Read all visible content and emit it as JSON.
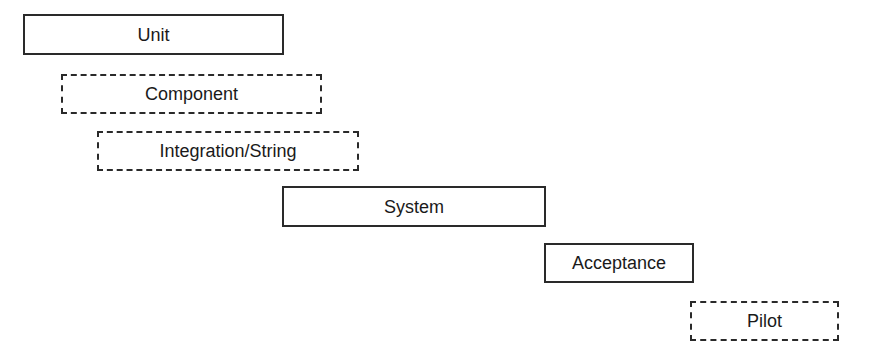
{
  "diagram": {
    "type": "staggered-test-stages",
    "stages": [
      {
        "label": "Unit",
        "style": "solid",
        "x": 23,
        "y": 14,
        "w": 261,
        "h": 41
      },
      {
        "label": "Component",
        "style": "dashed",
        "x": 61,
        "y": 74,
        "w": 261,
        "h": 40
      },
      {
        "label": "Integration/String",
        "style": "dashed",
        "x": 97,
        "y": 131,
        "w": 262,
        "h": 40
      },
      {
        "label": "System",
        "style": "solid",
        "x": 282,
        "y": 186,
        "w": 264,
        "h": 41
      },
      {
        "label": "Acceptance",
        "style": "solid",
        "x": 544,
        "y": 243,
        "w": 150,
        "h": 40
      },
      {
        "label": "Pilot",
        "style": "dashed",
        "x": 690,
        "y": 301,
        "w": 149,
        "h": 40
      }
    ]
  }
}
